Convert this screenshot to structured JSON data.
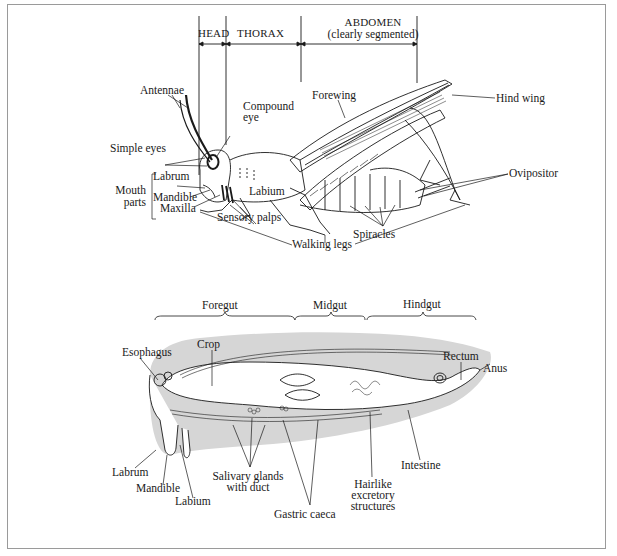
{
  "figure": {
    "top_diagram": {
      "title": "External anatomy of grasshopper",
      "regions": [
        {
          "label": "HEAD"
        },
        {
          "label": "THORAX"
        },
        {
          "label": "ABDOMEN"
        },
        {
          "label": "(clearly segmented)"
        }
      ],
      "labels": {
        "antennae": "Antennae",
        "compound_eye_1": "Compound",
        "compound_eye_2": "eye",
        "simple_eyes": "Simple eyes",
        "forewing": "Forewing",
        "hind_wing": "Hind wing",
        "ovipositor": "Ovipositor",
        "spiracles": "Spiracles",
        "labrum": "Labrum",
        "mouth_parts_1": "Mouth",
        "mouth_parts_2": "parts",
        "mandible": "Mandible",
        "maxilla": "Maxilla",
        "labium": "Labium",
        "sensory_palps": "Sensory palps",
        "walking_legs": "Walking legs"
      }
    },
    "bottom_diagram": {
      "title": "Internal digestive anatomy",
      "regions": [
        {
          "label": "Foregut"
        },
        {
          "label": "Midgut"
        },
        {
          "label": "Hindgut"
        }
      ],
      "labels": {
        "esophagus": "Esophagus",
        "crop": "Crop",
        "rectum": "Rectum",
        "anus": "Anus",
        "labrum": "Labrum",
        "mandible": "Mandible",
        "labium": "Labium",
        "salivary_1": "Salivary glands",
        "salivary_2": "with duct",
        "gastric_caeca": "Gastric caeca",
        "hairlike_1": "Hairlike",
        "hairlike_2": "excretory",
        "hairlike_3": "structures",
        "intestine": "Intestine"
      }
    }
  }
}
